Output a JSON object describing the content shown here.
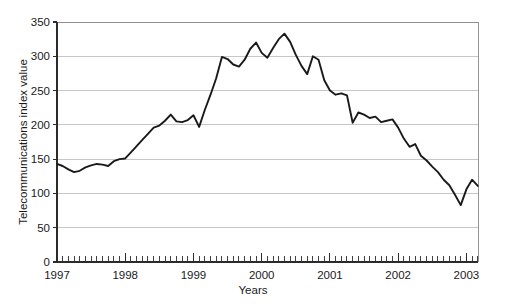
{
  "chart_data": {
    "type": "line",
    "title": "",
    "xlabel": "Years",
    "ylabel": "Telecommunications index value",
    "ylim": [
      0,
      350
    ],
    "xlim": [
      1997.0,
      2003.17
    ],
    "grid": true,
    "legend": false,
    "yticks": [
      0,
      50,
      100,
      150,
      200,
      250,
      300,
      350
    ],
    "ytick_labels": [
      "0",
      "50",
      "100",
      "150",
      "200",
      "250",
      "300",
      "350"
    ],
    "xticks": [
      1997,
      1998,
      1999,
      2000,
      2001,
      2002,
      2003
    ],
    "xtick_labels": [
      "1997",
      "1998",
      "1999",
      "2000",
      "2001",
      "2002",
      "2003"
    ],
    "x_minor_tick_interval_months": 1,
    "series": [
      {
        "name": "Telecommunications index",
        "color": "#1a1a1a",
        "x": [
          1997.0,
          1997.083,
          1997.167,
          1997.25,
          1997.333,
          1997.417,
          1997.5,
          1997.583,
          1997.667,
          1997.75,
          1997.833,
          1997.917,
          1998.0,
          1998.083,
          1998.167,
          1998.25,
          1998.333,
          1998.417,
          1998.5,
          1998.583,
          1998.667,
          1998.75,
          1998.833,
          1998.917,
          1999.0,
          1999.083,
          1999.167,
          1999.25,
          1999.333,
          1999.417,
          1999.5,
          1999.583,
          1999.667,
          1999.75,
          1999.833,
          1999.917,
          2000.0,
          2000.083,
          2000.167,
          2000.25,
          2000.333,
          2000.417,
          2000.5,
          2000.583,
          2000.667,
          2000.75,
          2000.833,
          2000.917,
          2001.0,
          2001.083,
          2001.167,
          2001.25,
          2001.333,
          2001.417,
          2001.5,
          2001.583,
          2001.667,
          2001.75,
          2001.833,
          2001.917,
          2002.0,
          2002.083,
          2002.167,
          2002.25,
          2002.333,
          2002.417,
          2002.5,
          2002.583,
          2002.667,
          2002.75,
          2002.833,
          2002.917,
          2003.0,
          2003.083,
          2003.167
        ],
        "values": [
          143,
          140,
          135,
          131,
          133,
          138,
          141,
          143,
          142,
          140,
          147,
          150,
          151,
          160,
          169,
          178,
          187,
          196,
          199,
          206,
          215,
          205,
          204,
          207,
          214,
          197,
          222,
          244,
          268,
          299,
          296,
          288,
          285,
          295,
          311,
          320,
          305,
          298,
          312,
          325,
          333,
          321,
          302,
          286,
          274,
          300,
          295,
          265,
          250,
          244,
          246,
          243,
          203,
          218,
          215,
          210,
          212,
          204,
          206,
          208,
          196,
          180,
          168,
          172,
          155,
          148,
          139,
          131,
          120,
          112,
          98,
          83,
          106,
          120,
          111
        ]
      }
    ],
    "annotations": []
  }
}
